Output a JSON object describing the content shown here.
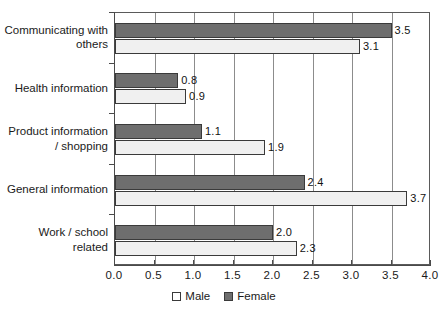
{
  "chart_data": {
    "type": "bar",
    "orientation": "horizontal",
    "title": "",
    "xlabel": "",
    "ylabel": "",
    "xlim": [
      0.0,
      4.0
    ],
    "xticks": [
      "0.0",
      "0.5",
      "1.0",
      "1.5",
      "2.0",
      "2.5",
      "3.0",
      "3.5",
      "4.0"
    ],
    "grid": true,
    "grid_axis": "x",
    "legend_position": "bottom-center",
    "categories": [
      "Communicating with\nothers",
      "Health information",
      "Product information\n/ shopping",
      "General information",
      "Work / school\nrelated"
    ],
    "series": [
      {
        "name": "Male",
        "color": "#f0f0f0",
        "values": [
          3.1,
          0.9,
          1.9,
          3.7,
          2.3
        ],
        "value_labels": [
          "3.1",
          "0.9",
          "1.9",
          "3.7",
          "2.3"
        ]
      },
      {
        "name": "Female",
        "color": "#6e6e6e",
        "values": [
          3.5,
          0.8,
          1.1,
          2.4,
          2.0
        ],
        "value_labels": [
          "3.5",
          "0.8",
          "1.1",
          "2.4",
          "2.0"
        ]
      }
    ]
  },
  "legend": {
    "items": [
      {
        "label": "Male",
        "swatch": "male"
      },
      {
        "label": "Female",
        "swatch": "female"
      }
    ]
  }
}
